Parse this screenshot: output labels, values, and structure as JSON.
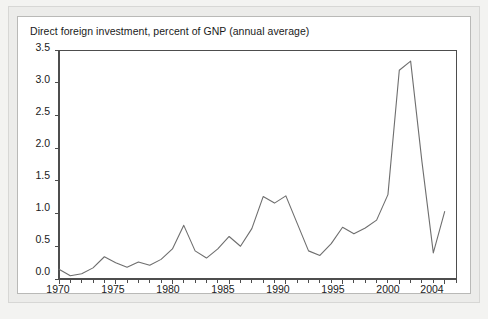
{
  "figure": {
    "title": "Direct foreign investment, percent of GNP (annual average)",
    "panel_background": "#ffffff",
    "mat_background": "#ececea",
    "page_background": "#f3f3f1",
    "line_color": "#6e6e6e",
    "axis_color": "#4d4d4d",
    "text_color": "#1a1a1a"
  },
  "chart_data": {
    "type": "line",
    "title": "Direct foreign investment, percent of GNP (annual average)",
    "xlabel": "",
    "ylabel": "",
    "xlim": [
      1970,
      2005
    ],
    "ylim": [
      0.0,
      3.5
    ],
    "grid": false,
    "legend": "none",
    "y_ticks": [
      "0.0",
      "0.5",
      "1.0",
      "1.5",
      "2.0",
      "2.5",
      "3.0",
      "3.5"
    ],
    "y_tick_values": [
      0.0,
      0.5,
      1.0,
      1.5,
      2.0,
      2.5,
      3.0,
      3.5
    ],
    "x_ticks": [
      "1970",
      "1975",
      "1980",
      "1985",
      "1990",
      "1995",
      "2000",
      "2004"
    ],
    "x_tick_values": [
      1970,
      1975,
      1980,
      1985,
      1990,
      1995,
      2000,
      2004
    ],
    "x_minor_tick_interval": 1,
    "series": [
      {
        "name": "Direct foreign investment, percent of GNP",
        "x": [
          1970,
          1971,
          1972,
          1973,
          1974,
          1975,
          1976,
          1977,
          1978,
          1979,
          1980,
          1981,
          1982,
          1983,
          1984,
          1985,
          1986,
          1987,
          1988,
          1989,
          1990,
          1991,
          1992,
          1993,
          1994,
          1995,
          1996,
          1997,
          1998,
          1999,
          2000,
          2001,
          2002,
          2003,
          2004
        ],
        "values": [
          0.15,
          0.05,
          0.08,
          0.17,
          0.34,
          0.25,
          0.18,
          0.26,
          0.21,
          0.3,
          0.46,
          0.82,
          0.43,
          0.32,
          0.46,
          0.65,
          0.5,
          0.77,
          1.26,
          1.16,
          1.27,
          0.85,
          0.43,
          0.36,
          0.54,
          0.79,
          0.69,
          0.78,
          0.9,
          1.29,
          3.19,
          3.33,
          1.79,
          0.4,
          1.03
        ]
      }
    ]
  },
  "axes": {
    "y_labels": [
      "3.5",
      "3.0",
      "2.5",
      "2.0",
      "1.5",
      "1.0",
      "0.5",
      "0.0"
    ],
    "x_labels": [
      "1970",
      "1975",
      "1980",
      "1985",
      "1990",
      "1995",
      "2000",
      "2004"
    ]
  }
}
